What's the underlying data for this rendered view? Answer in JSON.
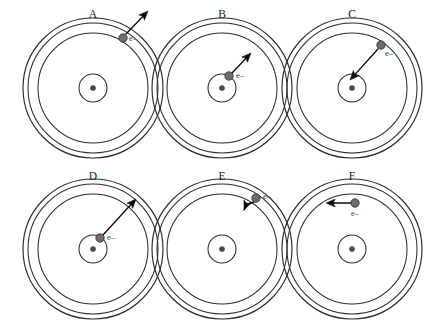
{
  "figure": {
    "background_color": "#ffffff",
    "width": 440,
    "height": 323,
    "ring_color": "#2b2b2b",
    "electron_color": "#6d6d6d",
    "arrow_color": "#0a0a0a",
    "nucleus_color": "#4a4a4a",
    "electron_label_text": "e–"
  },
  "panels": [
    {
      "id": "A",
      "label": "A",
      "label_x": 93,
      "label_y": 18,
      "center_x": 93,
      "center_y": 88,
      "shells": [
        70,
        65,
        55,
        14
      ],
      "electron": {
        "x": 123,
        "y": 38,
        "radius": 4.2,
        "shell_index": 0,
        "label": "e–",
        "label_x": 129,
        "label_y": 41
      },
      "arrow": {
        "x1": 126,
        "y1": 34,
        "x2": 148,
        "y2": 11,
        "type": "straight",
        "description": "outward escape from outer shell"
      }
    },
    {
      "id": "B",
      "label": "B",
      "label_x": 222,
      "label_y": 18,
      "center_x": 222,
      "center_y": 88,
      "shells": [
        70,
        65,
        55,
        14
      ],
      "electron": {
        "x": 229,
        "y": 76,
        "radius": 4.2,
        "shell_index": 3,
        "label": "e–",
        "label_x": 236,
        "label_y": 78
      },
      "arrow": {
        "x1": 232,
        "y1": 73,
        "x2": 251,
        "y2": 53,
        "type": "straight",
        "description": "inner shell to middle shell"
      }
    },
    {
      "id": "C",
      "label": "C",
      "label_x": 352,
      "label_y": 18,
      "center_x": 352,
      "center_y": 88,
      "shells": [
        70,
        65,
        55,
        14
      ],
      "electron": {
        "x": 381,
        "y": 45,
        "radius": 4.2,
        "shell_index": 2,
        "label": "e–",
        "label_x": 385,
        "label_y": 56
      },
      "arrow": {
        "x1": 378,
        "y1": 49,
        "x2": 350,
        "y2": 80,
        "type": "straight",
        "description": "middle shell inward to nucleus"
      }
    },
    {
      "id": "D",
      "label": "D",
      "label_x": 93,
      "label_y": 180,
      "center_x": 93,
      "center_y": 249,
      "shells": [
        70,
        65,
        55,
        14
      ],
      "electron": {
        "x": 100,
        "y": 238,
        "radius": 4.2,
        "shell_index": 3,
        "label": "e–",
        "label_x": 107,
        "label_y": 240
      },
      "arrow": {
        "x1": 103,
        "y1": 235,
        "x2": 136,
        "y2": 199,
        "type": "straight",
        "description": "inner shell to outer shell"
      }
    },
    {
      "id": "E",
      "label": "E",
      "label_x": 222,
      "label_y": 180,
      "center_x": 222,
      "center_y": 249,
      "shells": [
        70,
        65,
        55,
        14
      ],
      "electron": {
        "x": 256,
        "y": 198,
        "radius": 4.2,
        "shell_index": 0,
        "label": "e–",
        "label_x": 263,
        "label_y": 199
      },
      "arrow": {
        "x1": 254,
        "y1": 202,
        "x2": 244,
        "y2": 210,
        "type": "curved",
        "description": "tangential along outer shell"
      }
    },
    {
      "id": "F",
      "label": "F",
      "label_x": 352,
      "label_y": 180,
      "center_x": 352,
      "center_y": 249,
      "shells": [
        70,
        65,
        55,
        14
      ],
      "electron": {
        "x": 355,
        "y": 203,
        "radius": 4.2,
        "shell_index": 2,
        "label": "e–",
        "label_x": 351,
        "label_y": 216
      },
      "arrow": {
        "x1": 351,
        "y1": 203,
        "x2": 326,
        "y2": 203,
        "type": "straight",
        "description": "tangential leftward along middle shell"
      }
    }
  ]
}
